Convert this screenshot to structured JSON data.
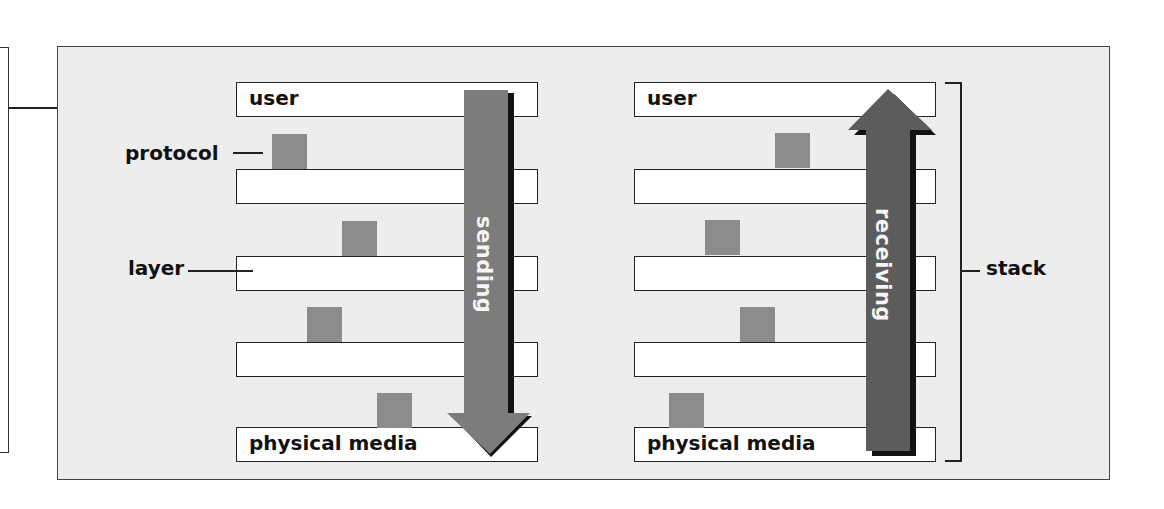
{
  "colors": {
    "panel_bg": "#ededed",
    "layer_bg": "#ffffff",
    "protocol_square": "#8c8c8c",
    "sending_arrow": "#7c7c7c",
    "receiving_arrow": "#5c5c5c",
    "shadow": "#111111"
  },
  "labels": {
    "protocol": "protocol",
    "layer": "layer",
    "stack": "stack"
  },
  "left_stack": {
    "layers": [
      {
        "label": "user"
      },
      {
        "label": ""
      },
      {
        "label": ""
      },
      {
        "label": ""
      },
      {
        "label": "physical media"
      }
    ],
    "arrow": {
      "label": "sending",
      "direction": "down"
    }
  },
  "right_stack": {
    "layers": [
      {
        "label": "user"
      },
      {
        "label": ""
      },
      {
        "label": ""
      },
      {
        "label": ""
      },
      {
        "label": "physical media"
      }
    ],
    "arrow": {
      "label": "receiving",
      "direction": "up"
    }
  }
}
